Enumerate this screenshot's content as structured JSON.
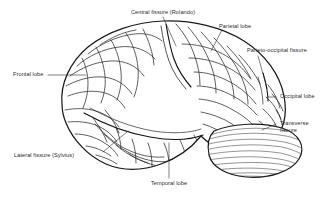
{
  "figure": {
    "type": "anatomical-diagram",
    "background_color": "#ffffff",
    "ink_color": "#1a1a1a",
    "text_color": "#2b2b2b"
  },
  "labels": {
    "central_fissure": "Central fissure (Rolando)",
    "parietal_lobe": "Parietal lobe",
    "parieto_occipital_fissure": "Parieto-occipital fissure",
    "occipital_lobe": "Occipital lobe",
    "transverse_fissure_line1": "Transverse",
    "transverse_fissure_line2": "fissure",
    "frontal_lobe": "Frontal lobe",
    "lateral_fissure": "Lateral fissure (Sylvius)",
    "temporal_lobe": "Temporal lobe"
  },
  "structures": [
    {
      "name": "frontal-lobe",
      "label": "Frontal lobe"
    },
    {
      "name": "parietal-lobe",
      "label": "Parietal lobe"
    },
    {
      "name": "occipital-lobe",
      "label": "Occipital lobe"
    },
    {
      "name": "temporal-lobe",
      "label": "Temporal lobe"
    },
    {
      "name": "cerebellum",
      "label": "Cerebellum"
    },
    {
      "name": "central-fissure",
      "label": "Central fissure (Rolando)"
    },
    {
      "name": "lateral-fissure",
      "label": "Lateral fissure (Sylvius)"
    },
    {
      "name": "parieto-occipital-fissure",
      "label": "Parieto-occipital fissure"
    },
    {
      "name": "transverse-fissure",
      "label": "Transverse fissure"
    }
  ]
}
